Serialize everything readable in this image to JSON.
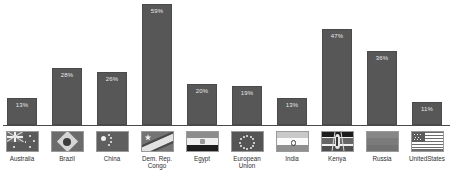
{
  "chart_data": {
    "type": "bar",
    "title": "",
    "xlabel": "",
    "ylabel": "",
    "ylim": [
      0,
      60
    ],
    "grid": false,
    "legend": "none",
    "value_label_position": "inside-top",
    "value_label_suffix": "%",
    "categories": [
      "Australia",
      "Brazil",
      "China",
      "Dem. Rep.\nCongo",
      "Egypt",
      "European\nUnion",
      "India",
      "Kenya",
      "Russia",
      "UnitedStates"
    ],
    "values": [
      13,
      28,
      26,
      59,
      20,
      19,
      13,
      47,
      36,
      11
    ],
    "value_labels": [
      "13%",
      "28%",
      "26%",
      "59%",
      "20%",
      "19%",
      "13%",
      "47%",
      "36%",
      "11%"
    ],
    "flags": [
      "australia-flag-icon",
      "brazil-flag-icon",
      "china-flag-icon",
      "dem-rep-congo-flag-icon",
      "egypt-flag-icon",
      "european-union-flag-icon",
      "india-flag-icon",
      "kenya-flag-icon",
      "russia-flag-icon",
      "united-states-flag-icon"
    ]
  },
  "style": {
    "bar_color": "#575757",
    "bar_border_color": "#4a4a4a",
    "value_label_color": "#e8e8e8",
    "axis_color": "#4a4a4a",
    "category_label_color": "#2e2e2e",
    "background": "#ffffff"
  }
}
